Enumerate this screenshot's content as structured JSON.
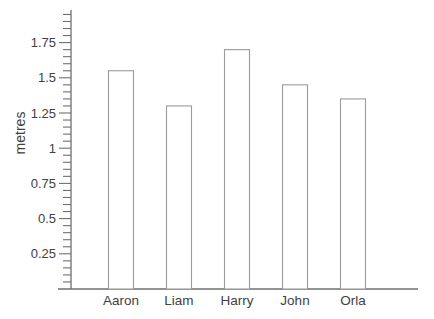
{
  "chart_data": {
    "type": "bar",
    "title": "",
    "categories": [
      "Aaron",
      "Liam",
      "Harry",
      "John",
      "Orla"
    ],
    "values": [
      1.55,
      1.3,
      1.7,
      1.45,
      1.35
    ],
    "xlabel": "",
    "ylabel": "metres",
    "ylim": [
      0,
      2
    ],
    "ytick_major_step": 0.25,
    "ytick_minor_step": 0.05,
    "ytick_labels": [
      "0.25",
      "0.5",
      "0.75",
      "1",
      "1.25",
      "1.5",
      "1.75"
    ],
    "grid": false,
    "legend_position": "none",
    "colors": {
      "bar_fill": "#ffffff",
      "bar_stroke": "#9b9b9b",
      "axis": "#6f6f6f",
      "text": "#414141"
    }
  }
}
